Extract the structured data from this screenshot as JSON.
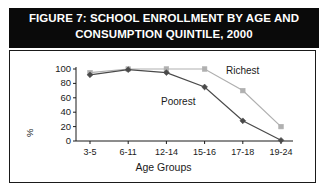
{
  "figure": {
    "title_line1": "FIGURE 7:  SCHOOL ENROLLMENT BY AGE AND",
    "title_line2": "CONSUMPTION QUINTILE, 2000",
    "title_bar_color": "#0a0a0a",
    "title_text_color": "#ffffff",
    "frame_border_color": "#1a1a1a",
    "background_color": "#ffffff"
  },
  "chart_data": {
    "type": "line",
    "title": "FIGURE 7:  SCHOOL ENROLLMENT BY AGE AND CONSUMPTION QUINTILE, 2000",
    "xlabel": "Age Groups",
    "ylabel": "%",
    "categories": [
      "3-5",
      "6-11",
      "12-14",
      "15-16",
      "17-18",
      "19-24"
    ],
    "ylim": [
      0,
      100
    ],
    "yticks": [
      0,
      20,
      40,
      60,
      80,
      100
    ],
    "grid": false,
    "legend": "inline-labels",
    "series": [
      {
        "name": "Richest",
        "color": "#b0b0b0",
        "marker": "square",
        "values": [
          95,
          100,
          100,
          100,
          70,
          20
        ],
        "label_text": "Richest"
      },
      {
        "name": "Poorest",
        "color": "#4a4a4a",
        "marker": "diamond",
        "values": [
          92,
          99,
          95,
          75,
          28,
          1
        ],
        "label_text": "Poorest"
      }
    ]
  }
}
